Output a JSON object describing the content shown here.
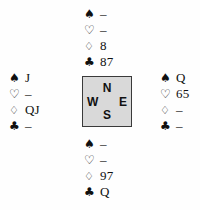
{
  "diagram": {
    "type": "bridge-deal-diagram",
    "suit_symbols": {
      "spades": "♠",
      "hearts": "♡",
      "diamonds": "♢",
      "clubs": "♣"
    },
    "void_marker": "–",
    "compass": {
      "north": "N",
      "west": "W",
      "east": "E",
      "south": "S",
      "fill_color": "#d9d9d9",
      "border_color": "#3a3a3a"
    },
    "hands": {
      "north": {
        "position_label": "North",
        "spades": "–",
        "hearts": "–",
        "diamonds": "8",
        "clubs": "87"
      },
      "west": {
        "position_label": "West",
        "spades": "J",
        "hearts": "–",
        "diamonds": "QJ",
        "clubs": "–"
      },
      "east": {
        "position_label": "East",
        "spades": "Q",
        "hearts": "65",
        "diamonds": "–",
        "clubs": "–"
      },
      "south": {
        "position_label": "South",
        "spades": "–",
        "hearts": "–",
        "diamonds": "97",
        "clubs": "Q"
      }
    }
  }
}
